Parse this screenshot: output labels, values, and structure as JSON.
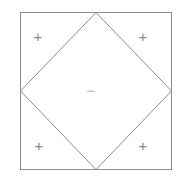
{
  "figure": {
    "background_color": "#ffffff",
    "stroke_color": "#8c8c8c",
    "stroke_width": 1,
    "outer_square": {
      "name": "outer-square",
      "left": 20,
      "top": 12,
      "right": 172,
      "bottom": 170,
      "width": 152,
      "height": 158
    },
    "inner_diamond": {
      "name": "inner-diamond",
      "points": "96,12 172,91 96,170 20,91",
      "vertices": [
        {
          "label": "top",
          "x": 96,
          "y": 12
        },
        {
          "label": "right",
          "x": 172,
          "y": 91
        },
        {
          "label": "bottom",
          "x": 96,
          "y": 170
        },
        {
          "label": "left",
          "x": 20,
          "y": 91
        }
      ]
    },
    "markers": [
      {
        "name": "plus-top-left",
        "symbol": "+",
        "kind": "plus",
        "x": 38,
        "y": 36,
        "color": "#8a8a8a"
      },
      {
        "name": "plus-top-right",
        "symbol": "+",
        "kind": "plus",
        "x": 143,
        "y": 36,
        "color": "#8a8a8a"
      },
      {
        "name": "plus-bottom-left",
        "symbol": "+",
        "kind": "plus",
        "x": 39,
        "y": 145,
        "color": "#8a8a8a"
      },
      {
        "name": "plus-bottom-right",
        "symbol": "+",
        "kind": "plus",
        "x": 143,
        "y": 145,
        "color": "#8a8a8a"
      },
      {
        "name": "minus-center",
        "symbol": "−",
        "kind": "minus",
        "x": 91,
        "y": 90,
        "color": "#b4b4b4"
      }
    ]
  }
}
